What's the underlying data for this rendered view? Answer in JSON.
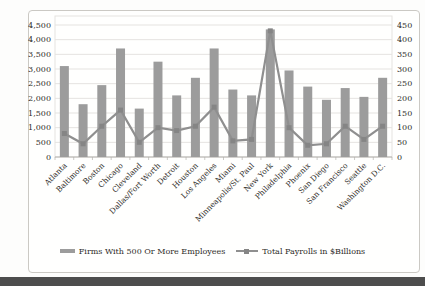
{
  "chart_data": {
    "type": "bar",
    "subtype": "bar-line-combo",
    "title": "",
    "categories": [
      "Atlanta",
      "Baltimore",
      "Boston",
      "Chicago",
      "Cleveland",
      "Dallas/Fort Worth",
      "Detroit",
      "Houston",
      "Los Angeles",
      "Miami",
      "Minneapolis/St. Paul",
      "New York",
      "Philadelphia",
      "Phoenix",
      "San Diego",
      "San Francisco",
      "Seattle",
      "Washington D.C."
    ],
    "series": [
      {
        "name": "Firms With 500 Or More Employees",
        "type": "bar",
        "axis": "left",
        "values": [
          3100,
          1800,
          2450,
          3700,
          1650,
          3250,
          2100,
          2700,
          3700,
          2300,
          2100,
          4350,
          2950,
          2400,
          1950,
          2350,
          2050,
          2700
        ]
      },
      {
        "name": "Total Payrolls in $Billions",
        "type": "line",
        "axis": "right",
        "values": [
          80,
          45,
          105,
          160,
          50,
          100,
          90,
          105,
          170,
          55,
          60,
          430,
          100,
          40,
          45,
          105,
          60,
          105
        ]
      }
    ],
    "left_axis": {
      "min": 0,
      "max": 4500,
      "step": 500,
      "tick_labels": [
        "0",
        "500",
        "1,000",
        "1,500",
        "2,000",
        "2,500",
        "3,000",
        "3,500",
        "4,000",
        "4,500"
      ]
    },
    "right_axis": {
      "min": 0,
      "max": 450,
      "step": 50,
      "tick_labels": [
        "0",
        "50",
        "100",
        "150",
        "200",
        "250",
        "300",
        "350",
        "400",
        "450"
      ]
    },
    "grid": true,
    "legend_position": "bottom",
    "colors": {
      "bar": "#9c9c9c",
      "line": "#8f8f8f",
      "marker": "#858585",
      "grid": "#e5e3e0",
      "axis": "#b3b1ad",
      "text": "#2e2c29",
      "chart_border": "#cbc9c4",
      "bottom_band": "#4d4d4d"
    }
  }
}
